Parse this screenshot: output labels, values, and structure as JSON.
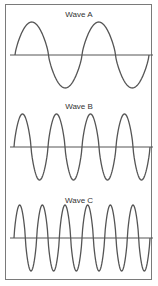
{
  "chart_data": {
    "type": "line",
    "title": "",
    "panels": [
      {
        "label": "Wave A",
        "cycles": 2,
        "x_start": 15,
        "x_end": 149,
        "baseline_y": 55,
        "amplitude": 33,
        "label_y": 10
      },
      {
        "label": "Wave B",
        "cycles": 4,
        "x_start": 14,
        "x_end": 150,
        "baseline_y": 147,
        "amplitude": 33,
        "label_y": 102
      },
      {
        "label": "Wave C",
        "cycles": 6,
        "x_start": 14,
        "x_end": 150,
        "baseline_y": 238,
        "amplitude": 33,
        "label_y": 196
      }
    ],
    "baseline": {
      "x_start": 10,
      "x_end": 153
    },
    "colors": {
      "wave": "#555555",
      "axis": "#555555",
      "frame": "#7a7a7a"
    },
    "grid": false,
    "legend": "none"
  },
  "waves": {
    "a": {
      "label": "Wave A"
    },
    "b": {
      "label": "Wave B"
    },
    "c": {
      "label": "Wave C"
    }
  }
}
